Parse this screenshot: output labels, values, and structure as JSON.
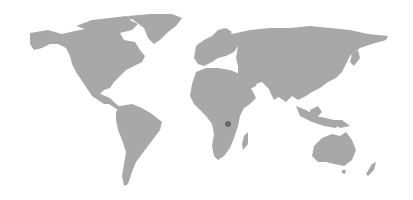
{
  "map": {
    "type": "world-map",
    "projection": "equirectangular-ish",
    "land_color": "#a8a8a8",
    "background_color": "#ffffff",
    "markers": [
      {
        "region": "Central Africa",
        "x": 228,
        "y": 124,
        "radius": 3,
        "color": "#6a6a6a"
      }
    ]
  }
}
